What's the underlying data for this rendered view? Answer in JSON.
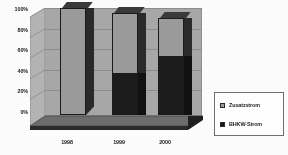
{
  "chart_data": {
    "type": "bar",
    "subtype": "stacked-column-3d",
    "title": "",
    "xlabel": "",
    "ylabel": "",
    "categories": [
      "1998",
      "1999",
      "2000"
    ],
    "ylim": [
      0,
      100
    ],
    "yticks": [
      "0%",
      "20%",
      "40%",
      "60%",
      "80%",
      "100%"
    ],
    "ytick_values": [
      0,
      20,
      40,
      60,
      80,
      100
    ],
    "grid": true,
    "legend_position": "right",
    "series": [
      {
        "name": "Zusatzstrom",
        "color": "#9b9b9b",
        "values": [
          100,
          56,
          36
        ]
      },
      {
        "name": "BHKW-Strom",
        "color": "#141414",
        "values": [
          0,
          39,
          55
        ]
      }
    ],
    "stack_totals": [
      100,
      95,
      91
    ],
    "value_unit": "%"
  },
  "axis": {
    "y": {
      "t100": "100%",
      "t80": "80%",
      "t60": "60%",
      "t40": "40%",
      "t20": "20%",
      "t0": "0%"
    },
    "x": {
      "c0": "1998",
      "c1": "1999",
      "c2": "2000"
    }
  },
  "legend": {
    "items": [
      {
        "label": "Zusatzstrom",
        "swatch": "light-gray-swatch"
      },
      {
        "label": "BHKW-Strom",
        "swatch": "dark-swatch"
      }
    ]
  }
}
